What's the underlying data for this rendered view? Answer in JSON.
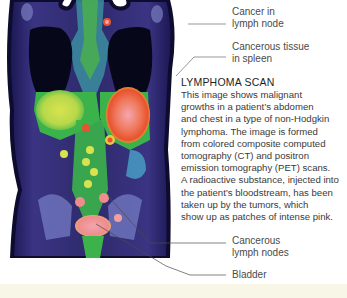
{
  "figure": {
    "image": {
      "subject": "PET-CT lymphoma scan of torso (coronal view)",
      "colors": {
        "background_tissue": "#2e2a6b",
        "outline": "#0d0b2e",
        "lungs": "#0a0a1c",
        "green_uptake": "#33b24a",
        "yellow_uptake": "#d8e04a",
        "red_uptake": "#e85a3c",
        "pink_uptake": "#f2a0a8",
        "bone": "#8a95cf"
      }
    },
    "annotations": [
      {
        "id": "cancer-lymph-node",
        "lines": [
          "Cancer in",
          "lymph  node"
        ]
      },
      {
        "id": "cancerous-tissue-spleen",
        "lines": [
          "Cancerous tissue",
          "in spleen"
        ]
      },
      {
        "id": "cancerous-lymph-nodes",
        "lines": [
          "Cancerous",
          "lymph nodes"
        ]
      },
      {
        "id": "bladder",
        "lines": [
          "Bladder"
        ]
      }
    ],
    "caption": {
      "title": "LYMPHOMA SCAN",
      "lines": [
        "This image shows malignant",
        "growths in a patient’s abdomen",
        "and chest in a type of non-Hodgkin",
        "lymphoma. The image is formed",
        "from colored composite computed",
        "tomography (CT) and positron",
        "emission tomography (PET) scans.",
        "A radioactive substance, injected into",
        "the patient’s bloodstream, has been",
        "taken up by the tumors, which",
        "show up as patches of intense pink."
      ]
    }
  },
  "page": {
    "background": "#ffffff",
    "bottom_strip_color": "#f8f6e6",
    "leader_line_color": "#6a6a6a"
  }
}
